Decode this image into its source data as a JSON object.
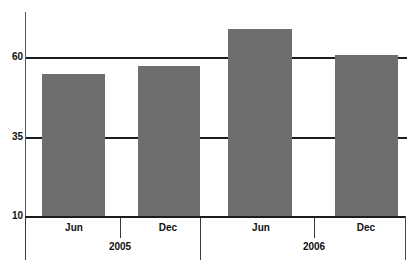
{
  "chart_data": {
    "type": "bar",
    "title": "",
    "xlabel": "",
    "ylabel": "",
    "categories": [
      "Jun",
      "Dec",
      "Jun",
      "Dec"
    ],
    "groups": [
      {
        "label": "2005",
        "categories": [
          "Jun",
          "Dec"
        ],
        "values": [
          55,
          57.5
        ]
      },
      {
        "label": "2006",
        "categories": [
          "Jun",
          "Dec"
        ],
        "values": [
          69,
          61
        ]
      }
    ],
    "values": [
      55,
      57.5,
      69,
      61
    ],
    "ylim": [
      10,
      72
    ],
    "yticks": [
      10,
      35,
      60
    ],
    "ytick_labels": [
      "10",
      "35",
      "60"
    ],
    "grid": true,
    "gridlines_at": [
      35,
      60
    ],
    "legend": "none",
    "bar_color": "#6e6e6e",
    "axis_color": "#1c1c1c",
    "background": "#ffffff"
  },
  "axis": {
    "y_ticks": [
      {
        "label": "60",
        "value": 60
      },
      {
        "label": "35",
        "value": 35
      },
      {
        "label": "10",
        "value": 10
      }
    ]
  },
  "bars": [
    {
      "label": "Jun",
      "group": "2005",
      "value": 55
    },
    {
      "label": "Dec",
      "group": "2005",
      "value": 57.5
    },
    {
      "label": "Jun",
      "group": "2006",
      "value": 69
    },
    {
      "label": "Dec",
      "group": "2006",
      "value": 61
    }
  ],
  "groups": [
    {
      "label": "2005"
    },
    {
      "label": "2006"
    }
  ],
  "title_remnant": {
    "left": "",
    "right": ""
  }
}
